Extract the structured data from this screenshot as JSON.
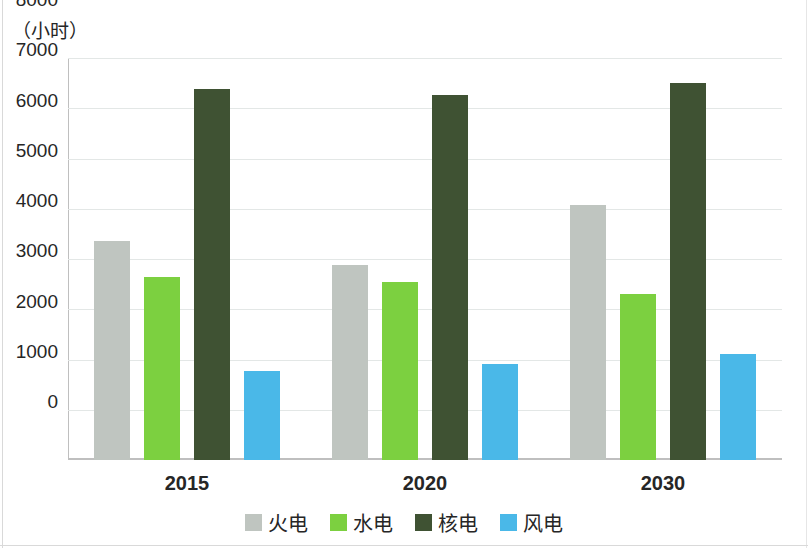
{
  "chart_data": {
    "type": "bar",
    "title": "",
    "subtitle": "",
    "unit_label": "（小时）",
    "xlabel": "",
    "ylabel": "",
    "categories": [
      "2015",
      "2020",
      "2030"
    ],
    "series": [
      {
        "name": "火电",
        "color": "#bfc5c0",
        "values": [
          4350,
          3880,
          5080
        ]
      },
      {
        "name": "水电",
        "color": "#7cd040",
        "values": [
          3650,
          3550,
          3300
        ]
      },
      {
        "name": "核电",
        "color": "#3f5233",
        "values": [
          7380,
          7260,
          7510
        ]
      },
      {
        "name": "风电",
        "color": "#4ab8e8",
        "values": [
          1770,
          1910,
          2100
        ]
      }
    ],
    "ylim": [
      0,
      8000
    ],
    "yticks": [
      0,
      1000,
      2000,
      3000,
      4000,
      5000,
      6000,
      7000,
      8000
    ],
    "ytick_labels": [
      "0",
      "1000",
      "2000",
      "3000",
      "4000",
      "5000",
      "6000",
      "7000",
      "8000"
    ],
    "grid": true,
    "grid_axis": "y",
    "legend_position": "bottom"
  }
}
